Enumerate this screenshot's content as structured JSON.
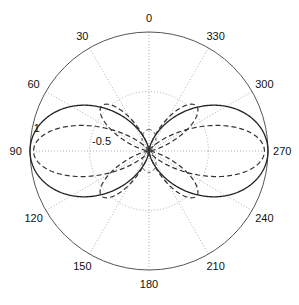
{
  "chart_data": {
    "type": "polar",
    "title": "",
    "angle_direction": "counterclockwise",
    "zero_location": "top",
    "angle_ticks": [
      0,
      30,
      60,
      90,
      120,
      150,
      180,
      210,
      240,
      270,
      300,
      330
    ],
    "angle_tick_labels": [
      "0",
      "30",
      "60",
      "90",
      "120",
      "150",
      "180",
      "210",
      "240",
      "270",
      "300",
      "330"
    ],
    "radial_tick_labels": [
      {
        "text": "1",
        "r": 1.0,
        "angle_deg": 80
      },
      {
        "text": "-0.5",
        "r": 0.5,
        "angle_deg": 82
      }
    ],
    "radial_range": [
      0,
      1
    ],
    "grid": {
      "rings": [
        0.5,
        1.0
      ],
      "spokes_every_deg": 30,
      "style": "dotted",
      "color": "#b0b0b0"
    },
    "series": [
      {
        "name": "pattern-1",
        "style": "solid",
        "color": "#222222",
        "formula": "sin^2(theta)",
        "max_angle_deg": [
          90,
          270
        ]
      },
      {
        "name": "pattern-2",
        "style": "dashed",
        "color": "#333333",
        "formula": "|sin^4(theta) ... main lobe| + side lobes",
        "main_lobe_deg": [
          90,
          270
        ],
        "side_lobes_deg": [
          40,
          140,
          220,
          320
        ]
      }
    ]
  }
}
